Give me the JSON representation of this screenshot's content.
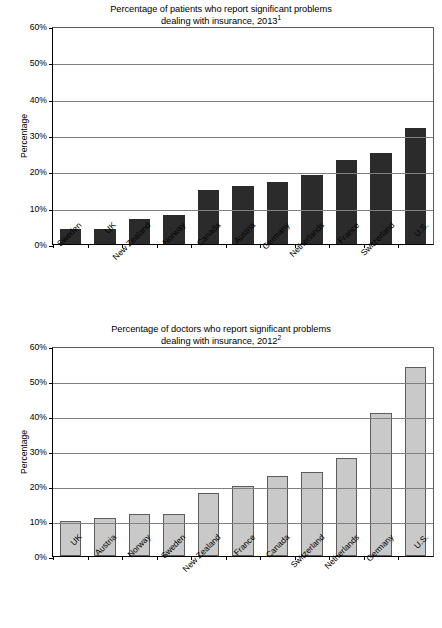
{
  "chart_data": [
    {
      "id": "patients",
      "type": "bar",
      "title": "Percentage of patients who report significant problems dealing with insurance, 2013",
      "title_line1": "Percentage of patients who report significant problems",
      "title_line2": "dealing with insurance, 2013",
      "title_footnote_marker": "1",
      "xlabel": "",
      "ylabel": "Percentage",
      "ylim": [
        0,
        60
      ],
      "ytick_labels": [
        "0%",
        "10%",
        "20%",
        "30%",
        "40%",
        "50%",
        "60%"
      ],
      "ytick_values": [
        0,
        10,
        20,
        30,
        40,
        50,
        60
      ],
      "grid": true,
      "legend": "none",
      "bar_color": "#2b2b2b",
      "categories": [
        "Sweden",
        "UK",
        "New Zealand",
        "Norway",
        "Canada",
        "Austria",
        "Germany",
        "Netherlands",
        "France",
        "Switzerland",
        "U.S."
      ],
      "values": [
        4,
        4,
        7,
        8,
        15,
        16,
        17,
        19,
        23,
        25,
        32
      ]
    },
    {
      "id": "doctors",
      "type": "bar",
      "title": "Percentage of doctors who report significant problems dealing with insurance, 2012",
      "title_line1": "Percentage of doctors who report significant problems",
      "title_line2": "dealing with insurance, 2012",
      "title_footnote_marker": "2",
      "xlabel": "",
      "ylabel": "Percentage",
      "ylim": [
        0,
        60
      ],
      "ytick_labels": [
        "0%",
        "10%",
        "20%",
        "30%",
        "40%",
        "50%",
        "60%"
      ],
      "ytick_values": [
        0,
        10,
        20,
        30,
        40,
        50,
        60
      ],
      "grid": true,
      "legend": "none",
      "bar_color": "#c9c9c9",
      "bar_edge_color": "#5c5c5c",
      "categories": [
        "UK",
        "Austria",
        "Norway",
        "Sweden",
        "New Zealand",
        "France",
        "Canada",
        "Switzerland",
        "Netherlands",
        "Germany",
        "U.S."
      ],
      "values": [
        10,
        11,
        12,
        12,
        18,
        20,
        23,
        24,
        28,
        41,
        54
      ]
    }
  ]
}
